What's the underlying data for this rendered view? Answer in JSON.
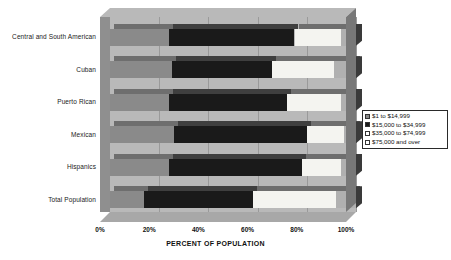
{
  "chart_data": {
    "type": "bar",
    "orientation": "horizontal",
    "stacked": true,
    "stacked_percent": true,
    "title": "",
    "xlabel": "PERCENT OF POPULATION",
    "ylabel": "",
    "xlim": [
      0,
      100
    ],
    "xticks": [
      "0%",
      "20%",
      "40%",
      "60%",
      "80%",
      "100%"
    ],
    "xtick_values": [
      0,
      20,
      40,
      60,
      80,
      100
    ],
    "grid": true,
    "grid_axis": "x",
    "legend_position": "right",
    "categories": [
      "Central and South American",
      "Cuban",
      "Puerto Rican",
      "Mexican",
      "Hispanics",
      "Total Population"
    ],
    "series": [
      {
        "name": "$1 to $14,999",
        "color": "#8a8a8a",
        "values": [
          24,
          25,
          24,
          26,
          24,
          14
        ]
      },
      {
        "name": "$15,000 to $34,999",
        "color": "#1a1a1a",
        "values": [
          51,
          41,
          48,
          54,
          54,
          44
        ]
      },
      {
        "name": "$35,000 to $74,999",
        "color": "#f4f4f0",
        "values": [
          19,
          25,
          22,
          15,
          16,
          34
        ]
      },
      {
        "name": "$75,000 and over",
        "color": "#b0b0b0",
        "values": [
          6,
          9,
          6,
          5,
          6,
          8
        ]
      }
    ]
  },
  "legend": {
    "items": [
      {
        "label": "$1 to $14,999"
      },
      {
        "label": "$15,000 to $34,999"
      },
      {
        "label": "$35,000 to $74,999"
      },
      {
        "label": "$75,000 and over"
      }
    ]
  },
  "axis": {
    "x_title": "PERCENT OF POPULATION",
    "x_ticks": [
      "0%",
      "20%",
      "40%",
      "60%",
      "80%",
      "100%"
    ],
    "y_labels": [
      "Central and South American",
      "Cuban",
      "Puerto Rican",
      "Mexican",
      "Hispanics",
      "Total Population"
    ]
  }
}
